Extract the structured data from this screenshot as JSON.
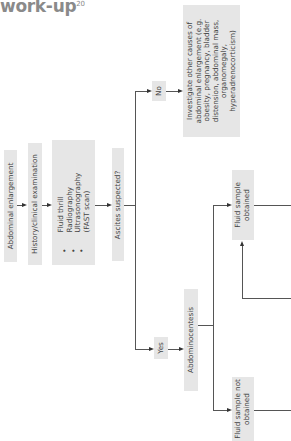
{
  "title": {
    "text": "work-up",
    "superscript": "20"
  },
  "orientation": "rotated -90deg (flow reads left-to-right when page is turned)",
  "nodes": {
    "abdominal_enlargement": "Abdominal enlargement",
    "history_exam": "History/clinical examination",
    "methods": {
      "items": [
        "Fluid thrill",
        "Radiography",
        "Ultrasonography",
        "(FAST scan)"
      ],
      "bullets": [
        "•",
        "•",
        "•"
      ]
    },
    "ascites_suspected": "Ascites suspected?",
    "no": "No",
    "yes": "Yes",
    "investigate_other": "Investigate other causes of abdominal enlargement (e.g. obesity, pregnancy, bladder distension, abdominal mass, organomegaly, hyperadrenocorticism)",
    "abdominocentesis": "Abdominocentesis",
    "fluid_obtained": "Fluid sample obtained",
    "fluid_not_obtained": "Fluid sample not obtained"
  },
  "colors": {
    "box_fill": "#e6e6e6",
    "line": "#555555",
    "title": "#8a8a8a"
  }
}
